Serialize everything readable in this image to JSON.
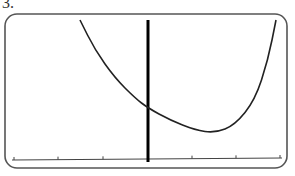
{
  "problem_label": "3.",
  "chart_data": {
    "type": "line",
    "title": "",
    "xlabel": "",
    "ylabel": "",
    "grid": false,
    "x_ticks_count": 6,
    "series": [
      {
        "name": "f(x)",
        "points_px": [
          [
            80,
            20
          ],
          [
            95,
            50
          ],
          [
            115,
            78
          ],
          [
            135,
            98
          ],
          [
            148,
            108
          ],
          [
            170,
            120
          ],
          [
            195,
            130
          ],
          [
            215,
            133
          ],
          [
            235,
            125
          ],
          [
            255,
            100
          ],
          [
            268,
            60
          ],
          [
            276,
            20
          ]
        ]
      }
    ],
    "axes": {
      "y_axis_x": 148,
      "x_axis_y": 160,
      "tick_positions_x": [
        14,
        58,
        103,
        192,
        236,
        280
      ]
    },
    "colors": {
      "curve": "#222222",
      "axis": "#000000",
      "frame": "#555555"
    }
  }
}
